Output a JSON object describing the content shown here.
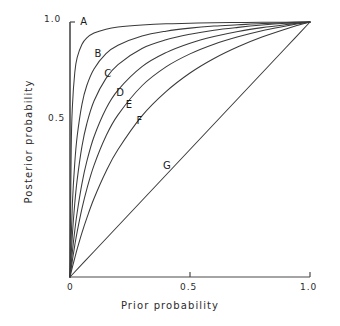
{
  "chart_data": {
    "type": "line",
    "title": "",
    "subtitle": "",
    "xlabel": "Prior probability",
    "ylabel": "Posterior probability",
    "xlim": [
      0,
      1
    ],
    "ylim": [
      0,
      1
    ],
    "grid": false,
    "legend_position": "inline-curve-labels",
    "x_ticks": [
      {
        "value": 0,
        "label": "0"
      },
      {
        "value": 0.5,
        "label": "0.5"
      },
      {
        "value": 1.0,
        "label": "1.0"
      }
    ],
    "y_ticks": [
      {
        "value": 0.5,
        "label": "0.5"
      },
      {
        "value": 1.0,
        "label": "1.0"
      }
    ],
    "annotations": [
      {
        "text": "A",
        "x": 0.055,
        "y": 1.0
      },
      {
        "text": "B",
        "x": 0.115,
        "y": 0.875
      },
      {
        "text": "C",
        "x": 0.155,
        "y": 0.795
      },
      {
        "text": "D",
        "x": 0.205,
        "y": 0.72
      },
      {
        "text": "E",
        "x": 0.245,
        "y": 0.675
      },
      {
        "text": "F",
        "x": 0.29,
        "y": 0.61
      },
      {
        "text": "G",
        "x": 0.4,
        "y": 0.435
      }
    ],
    "series": [
      {
        "name": "A",
        "likelihood_ratio": 200,
        "x": [
          0,
          0.005,
          0.01,
          0.02,
          0.03,
          0.05,
          0.07,
          0.1,
          0.15,
          0.2,
          0.3,
          0.4,
          0.5,
          0.6,
          0.7,
          0.8,
          0.9,
          0.95,
          1.0
        ],
        "y": [
          0,
          0.501,
          0.669,
          0.803,
          0.861,
          0.913,
          0.938,
          0.957,
          0.972,
          0.98,
          0.988,
          0.993,
          0.995,
          0.997,
          0.998,
          0.999,
          0.999,
          1.0,
          1.0
        ]
      },
      {
        "name": "B",
        "likelihood_ratio": 40,
        "x": [
          0,
          0.01,
          0.02,
          0.03,
          0.05,
          0.07,
          0.1,
          0.15,
          0.2,
          0.3,
          0.4,
          0.5,
          0.6,
          0.7,
          0.8,
          0.9,
          0.95,
          1.0
        ],
        "y": [
          0,
          0.288,
          0.449,
          0.553,
          0.678,
          0.751,
          0.816,
          0.876,
          0.909,
          0.945,
          0.964,
          0.976,
          0.984,
          0.989,
          0.994,
          0.997,
          0.999,
          1.0
        ]
      },
      {
        "name": "C",
        "likelihood_ratio": 20,
        "x": [
          0,
          0.01,
          0.02,
          0.03,
          0.05,
          0.07,
          0.1,
          0.15,
          0.2,
          0.3,
          0.4,
          0.5,
          0.6,
          0.7,
          0.8,
          0.9,
          0.95,
          1.0
        ],
        "y": [
          0,
          0.168,
          0.29,
          0.382,
          0.513,
          0.601,
          0.69,
          0.779,
          0.833,
          0.896,
          0.93,
          0.952,
          0.968,
          0.979,
          0.988,
          0.995,
          0.997,
          1.0
        ]
      },
      {
        "name": "D",
        "likelihood_ratio": 11,
        "x": [
          0,
          0.01,
          0.02,
          0.03,
          0.05,
          0.07,
          0.1,
          0.15,
          0.2,
          0.3,
          0.4,
          0.5,
          0.6,
          0.7,
          0.8,
          0.9,
          0.95,
          1.0
        ],
        "y": [
          0,
          0.1,
          0.183,
          0.254,
          0.367,
          0.453,
          0.55,
          0.66,
          0.733,
          0.825,
          0.88,
          0.917,
          0.943,
          0.963,
          0.978,
          0.99,
          0.995,
          1.0
        ]
      },
      {
        "name": "E",
        "likelihood_ratio": 7,
        "x": [
          0,
          0.01,
          0.02,
          0.03,
          0.05,
          0.07,
          0.1,
          0.15,
          0.2,
          0.3,
          0.4,
          0.5,
          0.6,
          0.7,
          0.8,
          0.9,
          0.95,
          1.0
        ],
        "y": [
          0,
          0.066,
          0.125,
          0.178,
          0.269,
          0.345,
          0.438,
          0.553,
          0.636,
          0.75,
          0.824,
          0.875,
          0.913,
          0.942,
          0.966,
          0.984,
          0.993,
          1.0
        ]
      },
      {
        "name": "F",
        "likelihood_ratio": 4,
        "x": [
          0,
          0.01,
          0.02,
          0.03,
          0.05,
          0.07,
          0.1,
          0.15,
          0.2,
          0.3,
          0.4,
          0.5,
          0.6,
          0.7,
          0.8,
          0.9,
          0.95,
          1.0
        ],
        "y": [
          0,
          0.039,
          0.075,
          0.11,
          0.174,
          0.231,
          0.308,
          0.414,
          0.5,
          0.632,
          0.727,
          0.8,
          0.857,
          0.903,
          0.941,
          0.973,
          0.987,
          1.0
        ]
      },
      {
        "name": "G",
        "likelihood_ratio": 1,
        "x": [
          0,
          0.1,
          0.2,
          0.3,
          0.4,
          0.5,
          0.6,
          0.7,
          0.8,
          0.9,
          1.0
        ],
        "y": [
          0,
          0.1,
          0.2,
          0.3,
          0.4,
          0.5,
          0.6,
          0.7,
          0.8,
          0.9,
          1.0
        ]
      }
    ]
  },
  "axes": {
    "x_title": "Prior probability",
    "y_title": "Posterior probability",
    "x_tick_labels": [
      "0",
      "0.5",
      "1.0"
    ],
    "y_tick_labels": [
      "0.5",
      "1.0"
    ]
  },
  "curve_labels": [
    "A",
    "B",
    "C",
    "D",
    "E",
    "F",
    "G"
  ],
  "colors": {
    "axis": "#4a4a4a",
    "curve": "#3a3a3a",
    "text": "#1a1a1a",
    "background": "#ffffff"
  }
}
